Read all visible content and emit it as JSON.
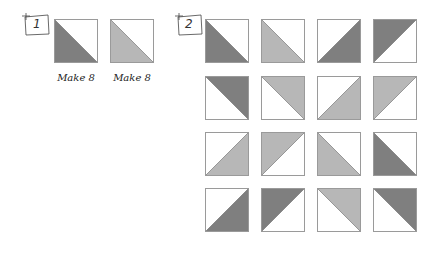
{
  "colors": {
    "dark": "#7f7f7f",
    "light": "#b7b7b7",
    "white": "#ffffff",
    "border": "#9a9a9a"
  },
  "step1": {
    "number": "1",
    "units": [
      {
        "fill": "dark",
        "corner": "bottom-left",
        "label": "Make 8"
      },
      {
        "fill": "light",
        "corner": "bottom-left",
        "label": "Make 8"
      }
    ]
  },
  "step2": {
    "number": "2",
    "grid": [
      [
        {
          "fill": "dark",
          "corner": "bottom-left"
        },
        {
          "fill": "light",
          "corner": "bottom-left"
        },
        {
          "fill": "dark",
          "corner": "bottom-right"
        },
        {
          "fill": "dark",
          "corner": "top-left"
        }
      ],
      [
        {
          "fill": "dark",
          "corner": "top-right"
        },
        {
          "fill": "light",
          "corner": "top-right"
        },
        {
          "fill": "light",
          "corner": "bottom-right"
        },
        {
          "fill": "light",
          "corner": "top-left"
        }
      ],
      [
        {
          "fill": "light",
          "corner": "bottom-right"
        },
        {
          "fill": "light",
          "corner": "top-left"
        },
        {
          "fill": "light",
          "corner": "bottom-left"
        },
        {
          "fill": "dark",
          "corner": "bottom-left"
        }
      ],
      [
        {
          "fill": "dark",
          "corner": "bottom-right"
        },
        {
          "fill": "dark",
          "corner": "top-left"
        },
        {
          "fill": "light",
          "corner": "top-right"
        },
        {
          "fill": "dark",
          "corner": "top-right"
        }
      ]
    ]
  }
}
